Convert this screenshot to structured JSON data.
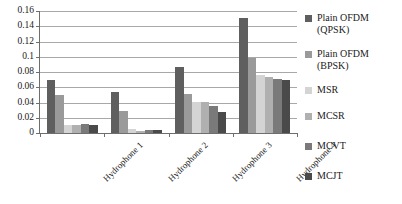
{
  "chart_data": {
    "type": "bar",
    "title": "",
    "subtitle": "",
    "xlabel": "",
    "ylabel": "",
    "categories": [
      "Hydrophone 1",
      "Hydrophone 2",
      "Hydrophone 3",
      "Hydrophone 4"
    ],
    "ylim": [
      0,
      0.16
    ],
    "y_ticks": [
      "0.16",
      "0.14",
      "0.12",
      "0.1",
      "0.08",
      "0.06",
      "0.04",
      "0.02",
      "0"
    ],
    "y_tick_values": [
      0.16,
      0.14,
      0.12,
      0.1,
      0.08,
      0.06,
      0.04,
      0.02,
      0
    ],
    "grid": true,
    "legend_position": "right",
    "series": [
      {
        "name": "Plain OFDM (QPSK)",
        "color": "#5f5f5f",
        "values": [
          0.069,
          0.054,
          0.087,
          0.151
        ]
      },
      {
        "name": "Plain OFDM (BPSK)",
        "color": "#9a9a9a",
        "values": [
          0.05,
          0.029,
          0.051,
          0.098
        ]
      },
      {
        "name": "MSR",
        "color": "#d4d4d4",
        "values": [
          0.01,
          0.005,
          0.041,
          0.076
        ]
      },
      {
        "name": "MCSR",
        "color": "#b0b0b0",
        "values": [
          0.011,
          0.002,
          0.041,
          0.074
        ]
      },
      {
        "name": "MCVT",
        "color": "#7a7a7a",
        "values": [
          0.012,
          0.004,
          0.036,
          0.071
        ]
      },
      {
        "name": "MCJT",
        "color": "#4a4a4a",
        "values": [
          0.011,
          0.004,
          0.028,
          0.069
        ]
      }
    ]
  },
  "legend": {
    "items": [
      {
        "label": "Plain OFDM\n(QPSK)",
        "color": "#5f5f5f"
      },
      {
        "label": "Plain OFDM\n(BPSK)",
        "color": "#9a9a9a"
      },
      {
        "label": "MSR",
        "color": "#d4d4d4"
      },
      {
        "label": "MCSR",
        "color": "#b0b0b0"
      },
      {
        "label": "MCVT",
        "color": "#7a7a7a"
      },
      {
        "label": "MCJT",
        "color": "#4a4a4a"
      }
    ]
  }
}
